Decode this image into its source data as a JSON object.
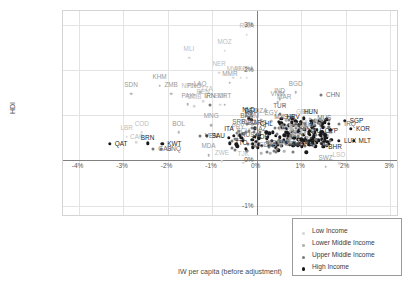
{
  "chart_data": {
    "type": "scatter",
    "title": "",
    "xlabel": "IW per capita (before adjustment)",
    "ylabel": "HDI",
    "xlim": [
      -4.35,
      3.2
    ],
    "ylim": [
      -1.25,
      3.3
    ],
    "grid": true,
    "xticks": [
      "-4%",
      "-3%",
      "-2%",
      "-1%",
      "0%",
      "1%",
      "2%",
      "3%"
    ],
    "xtickvals": [
      -4,
      -3,
      -2,
      -1,
      0,
      1,
      2,
      3
    ],
    "yticks": [
      "3%",
      "2%",
      "1%",
      "0%",
      "-1%"
    ],
    "ytickvals": [
      3,
      2,
      1,
      0,
      -1
    ],
    "legend_position": "bottom-right",
    "legend": [
      {
        "label": "Low Income",
        "class": "c0",
        "color": "#d9d9d9"
      },
      {
        "label": "Lower Middle Income",
        "class": "c1",
        "color": "#b3b3b3"
      },
      {
        "label": "Upper Middle Income",
        "class": "c2",
        "color": "#7a7a7a"
      },
      {
        "label": "High Income",
        "class": "c3",
        "color": "#1a1a1a"
      }
    ],
    "points": [
      {
        "label": "RWA",
        "x": -0.22,
        "y": 2.78,
        "g": 0,
        "dx": 0,
        "dy": -0.08
      },
      {
        "label": "MOZ",
        "x": -0.72,
        "y": 2.42,
        "g": 0,
        "dx": 0,
        "dy": -0.08
      },
      {
        "label": "MLI",
        "x": -1.52,
        "y": 2.27,
        "g": 0,
        "dx": 0,
        "dy": -0.08
      },
      {
        "label": "NER",
        "x": -0.84,
        "y": 1.94,
        "g": 0,
        "dx": 0,
        "dy": -0.08
      },
      {
        "label": "MWI",
        "x": -0.52,
        "y": 1.83,
        "g": 0,
        "dx": 0,
        "dy": -0.08
      },
      {
        "label": "AFG",
        "x": -0.36,
        "y": 1.83,
        "g": 0,
        "dx": 0,
        "dy": -0.08
      },
      {
        "label": "UGA",
        "x": -0.22,
        "y": 1.83,
        "g": 0,
        "dx": 0,
        "dy": -0.08
      },
      {
        "label": "MMR",
        "x": -0.6,
        "y": 1.72,
        "g": 1,
        "dx": 0,
        "dy": -0.08
      },
      {
        "label": "KHM",
        "x": -2.18,
        "y": 1.65,
        "g": 1,
        "dx": 0,
        "dy": -0.08
      },
      {
        "label": "BGD",
        "x": 0.88,
        "y": 1.5,
        "g": 1,
        "dx": 0,
        "dy": -0.08
      },
      {
        "label": "CHN",
        "x": 1.45,
        "y": 1.44,
        "g": 2,
        "dx": 0.14,
        "dy": 0
      },
      {
        "label": "SDN",
        "x": -2.82,
        "y": 1.47,
        "g": 1,
        "dx": 0,
        "dy": -0.08
      },
      {
        "label": "ZMB",
        "x": -1.92,
        "y": 1.47,
        "g": 1,
        "dx": 0,
        "dy": -0.08
      },
      {
        "label": "NPL",
        "x": -1.55,
        "y": 1.45,
        "g": 0,
        "dx": 0,
        "dy": -0.08
      },
      {
        "label": "PNG",
        "x": -1.4,
        "y": 1.45,
        "g": 1,
        "dx": 0,
        "dy": -0.08
      },
      {
        "label": "LAO",
        "x": -1.27,
        "y": 1.5,
        "g": 1,
        "dx": 0,
        "dy": -0.08
      },
      {
        "label": "TZA",
        "x": -1.12,
        "y": 1.39,
        "g": 0,
        "dx": 0,
        "dy": -0.08
      },
      {
        "label": "BEN",
        "x": -1.2,
        "y": 1.31,
        "g": 0,
        "dx": 0,
        "dy": -0.08
      },
      {
        "label": "PAK",
        "x": -1.55,
        "y": 1.24,
        "g": 1,
        "dx": 0,
        "dy": -0.08
      },
      {
        "label": "GMB",
        "x": -1.4,
        "y": 1.2,
        "g": 0,
        "dx": 0,
        "dy": -0.08
      },
      {
        "label": "IRN",
        "x": -1.05,
        "y": 1.23,
        "g": 2,
        "dx": 0,
        "dy": -0.08
      },
      {
        "label": "BDI",
        "x": -0.82,
        "y": 1.23,
        "g": 0,
        "dx": 0,
        "dy": -0.08
      },
      {
        "label": "MRT",
        "x": -0.72,
        "y": 1.23,
        "g": 1,
        "dx": 0,
        "dy": -0.08
      },
      {
        "label": "IND",
        "x": 0.52,
        "y": 1.35,
        "g": 1,
        "dx": 0,
        "dy": -0.08
      },
      {
        "label": "VNM",
        "x": 0.47,
        "y": 1.28,
        "g": 1,
        "dx": 0,
        "dy": -0.08
      },
      {
        "label": "MAR",
        "x": 0.62,
        "y": 1.21,
        "g": 1,
        "dx": 0,
        "dy": -0.08
      },
      {
        "label": "TUR",
        "x": 0.52,
        "y": 1.02,
        "g": 2,
        "dx": 0,
        "dy": -0.08
      },
      {
        "label": "GIN",
        "x": 1.02,
        "y": 0.88,
        "g": 0,
        "dx": 0,
        "dy": -0.08
      },
      {
        "label": "SLE",
        "x": 1.12,
        "y": 0.88,
        "g": 0,
        "dx": 0,
        "dy": -0.08
      },
      {
        "label": "HUN",
        "x": 1.22,
        "y": 0.88,
        "g": 3,
        "dx": 0,
        "dy": -0.08
      },
      {
        "label": "SGP",
        "x": 1.98,
        "y": 0.88,
        "g": 3,
        "dx": 0.13,
        "dy": 0
      },
      {
        "label": "IRQ",
        "x": 1.86,
        "y": 0.8,
        "g": 2,
        "dx": 0.12,
        "dy": -0.02
      },
      {
        "label": "KOR",
        "x": 2.12,
        "y": 0.7,
        "g": 3,
        "dx": 0.13,
        "dy": 0
      },
      {
        "label": "NLD",
        "x": -0.18,
        "y": 0.93,
        "g": 3,
        "dx": 0,
        "dy": -0.08
      },
      {
        "label": "DEU",
        "x": -0.12,
        "y": 0.9,
        "g": 3,
        "dx": 0,
        "dy": -0.08
      },
      {
        "label": "DZA",
        "x": 0.1,
        "y": 0.9,
        "g": 1,
        "dx": 0,
        "dy": -0.08
      },
      {
        "label": "EGY",
        "x": 0.33,
        "y": 0.86,
        "g": 1,
        "dx": 0,
        "dy": -0.08
      },
      {
        "label": "BRA",
        "x": -0.22,
        "y": 0.8,
        "g": 2,
        "dx": 0,
        "dy": -0.08
      },
      {
        "label": "YEM",
        "x": -0.1,
        "y": 0.8,
        "g": 1,
        "dx": 0,
        "dy": -0.08
      },
      {
        "label": "MYS",
        "x": 0.55,
        "y": 0.76,
        "g": 2,
        "dx": 0,
        "dy": -0.08
      },
      {
        "label": "LKA",
        "x": 0.72,
        "y": 0.76,
        "g": 1,
        "dx": 0,
        "dy": -0.08
      },
      {
        "label": "HRV",
        "x": 0.82,
        "y": 0.76,
        "g": 3,
        "dx": 0,
        "dy": -0.08
      },
      {
        "label": "MUS",
        "x": 1.52,
        "y": 0.74,
        "g": 2,
        "dx": 0,
        "dy": -0.08
      },
      {
        "label": "SRB",
        "x": -0.4,
        "y": 0.66,
        "g": 2,
        "dx": 0,
        "dy": -0.08
      },
      {
        "label": "ROU",
        "x": -0.18,
        "y": 0.66,
        "g": 2,
        "dx": 0,
        "dy": -0.08
      },
      {
        "label": "BGR",
        "x": -0.05,
        "y": 0.63,
        "g": 2,
        "dx": 0,
        "dy": -0.08
      },
      {
        "label": "ARG",
        "x": 0.08,
        "y": 0.63,
        "g": 2,
        "dx": 0,
        "dy": -0.08
      },
      {
        "label": "CHL",
        "x": 0.22,
        "y": 0.62,
        "g": 3,
        "dx": 0,
        "dy": -0.08
      },
      {
        "label": "PAN",
        "x": 0.98,
        "y": 0.6,
        "g": 2,
        "dx": 0,
        "dy": -0.08
      },
      {
        "label": "GHA",
        "x": 1.18,
        "y": 0.6,
        "g": 1,
        "dx": 0,
        "dy": -0.08
      },
      {
        "label": "PRY",
        "x": -0.42,
        "y": 0.55,
        "g": 1,
        "dx": 0,
        "dy": -0.08
      },
      {
        "label": "ITA",
        "x": -0.62,
        "y": 0.5,
        "g": 3,
        "dx": 0,
        "dy": -0.08
      },
      {
        "label": "ECU",
        "x": -0.3,
        "y": 0.46,
        "g": 1,
        "dx": 0,
        "dy": -0.08
      },
      {
        "label": "KAZ",
        "x": 0.08,
        "y": 0.5,
        "g": 2,
        "dx": 0,
        "dy": -0.08
      },
      {
        "label": "MDG",
        "x": 0.66,
        "y": 0.5,
        "g": 0,
        "dx": 0,
        "dy": -0.08
      },
      {
        "label": "NTU",
        "x": 1.3,
        "y": 0.47,
        "g": 3,
        "dx": 0,
        "dy": -0.08
      },
      {
        "label": "CYP",
        "x": 1.68,
        "y": 0.46,
        "g": 3,
        "dx": 0,
        "dy": -0.08
      },
      {
        "label": "LUX",
        "x": 1.85,
        "y": 0.43,
        "g": 3,
        "dx": 0.02,
        "dy": 0
      },
      {
        "label": "MLT",
        "x": 2.18,
        "y": 0.43,
        "g": 3,
        "dx": 0.13,
        "dy": 0
      },
      {
        "label": "TTO",
        "x": -0.6,
        "y": 0.38,
        "g": 3,
        "dx": 0.1,
        "dy": 0
      },
      {
        "label": "RUS",
        "x": -0.2,
        "y": 0.36,
        "g": 2,
        "dx": 0,
        "dy": -0.08
      },
      {
        "label": "NOR",
        "x": 0.12,
        "y": 0.32,
        "g": 3,
        "dx": 0,
        "dy": -0.08
      },
      {
        "label": "IDN",
        "x": 0.92,
        "y": 0.37,
        "g": 1,
        "dx": 0,
        "dy": -0.08
      },
      {
        "label": "BHR",
        "x": 1.5,
        "y": 0.3,
        "g": 3,
        "dx": 0.12,
        "dy": 0
      },
      {
        "label": "MNG",
        "x": -1.02,
        "y": 0.78,
        "g": 1,
        "dx": 0,
        "dy": -0.08
      },
      {
        "label": "BOL",
        "x": -1.75,
        "y": 0.62,
        "g": 1,
        "dx": 0,
        "dy": -0.08
      },
      {
        "label": "VEN",
        "x": -1.28,
        "y": 0.55,
        "g": 2,
        "dx": 0.1,
        "dy": 0
      },
      {
        "label": "SAU",
        "x": -1.12,
        "y": 0.55,
        "g": 3,
        "dx": 0.08,
        "dy": 0
      },
      {
        "label": "COD",
        "x": -2.58,
        "y": 0.62,
        "g": 0,
        "dx": 0,
        "dy": -0.08
      },
      {
        "label": "LBR",
        "x": -2.92,
        "y": 0.52,
        "g": 0,
        "dx": 0,
        "dy": -0.08
      },
      {
        "label": "QAT",
        "x": -3.3,
        "y": 0.37,
        "g": 3,
        "dx": 0.12,
        "dy": 0
      },
      {
        "label": "CAF",
        "x": -2.7,
        "y": 0.4,
        "g": 0,
        "dx": 0,
        "dy": 0
      },
      {
        "label": "BRN",
        "x": -2.45,
        "y": 0.38,
        "g": 3,
        "dx": 0,
        "dy": 0
      },
      {
        "label": "KWT",
        "x": -2.12,
        "y": 0.37,
        "g": 3,
        "dx": 0.13,
        "dy": 0
      },
      {
        "label": "GAB",
        "x": -2.32,
        "y": 0.26,
        "g": 2,
        "dx": 0.1,
        "dy": 0
      },
      {
        "label": "GNQ",
        "x": -2.14,
        "y": 0.26,
        "g": 2,
        "dx": 0.08,
        "dy": 0
      },
      {
        "label": "MDA",
        "x": -1.08,
        "y": 0.12,
        "g": 1,
        "dx": 0,
        "dy": -0.08
      },
      {
        "label": "NER2",
        "x": 0.4,
        "y": 0.2,
        "g": 2,
        "dx": 0,
        "dy": -0.08
      },
      {
        "label": "JAM",
        "x": 0.82,
        "y": 0.18,
        "g": 2,
        "dx": 0,
        "dy": -0.08
      },
      {
        "label": "BRB",
        "x": 1.12,
        "y": 0.18,
        "g": 3,
        "dx": 0,
        "dy": -0.08
      },
      {
        "label": "UKR",
        "x": 0.62,
        "y": 0.2,
        "g": 1,
        "dx": 0,
        "dy": -0.08
      },
      {
        "label": "KGZ",
        "x": 0.1,
        "y": 0.16,
        "g": 1,
        "dx": 0,
        "dy": -0.08
      },
      {
        "label": "UZB",
        "x": 0.3,
        "y": 0.16,
        "g": 1,
        "dx": 0,
        "dy": -0.08
      },
      {
        "label": "ZWE",
        "x": -0.78,
        "y": -0.02,
        "g": 0,
        "dx": 0,
        "dy": -0.08
      },
      {
        "label": "TJK",
        "x": -0.3,
        "y": -0.05,
        "g": 0,
        "dx": 0,
        "dy": -0.08
      },
      {
        "label": "SWZ",
        "x": 1.55,
        "y": -0.14,
        "g": 1,
        "dx": 0,
        "dy": -0.08
      },
      {
        "label": "LSO",
        "x": 1.85,
        "y": -0.06,
        "g": 0,
        "dx": 0,
        "dy": -0.08
      }
    ],
    "cluster_note": "dense unlabeled cluster between 0.5% and 1.6% near 0.3-0.8 HDI"
  }
}
